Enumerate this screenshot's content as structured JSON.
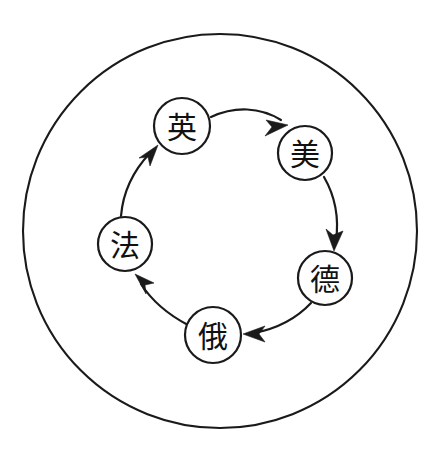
{
  "diagram": {
    "type": "cycle-diagram",
    "title": "",
    "background_color": "#ffffff",
    "stroke_color": "#1a1a1a",
    "outer_boundary": {
      "name": "outer-circle",
      "shape": "circle",
      "cx": 220,
      "cy": 231,
      "r": 197
    },
    "nodes": [
      {
        "id": "uk",
        "label": "英",
        "cx": 182,
        "cy": 126,
        "r": 28
      },
      {
        "id": "usa",
        "label": "美",
        "cx": 305,
        "cy": 153,
        "r": 27
      },
      {
        "id": "germany",
        "label": "德",
        "cx": 325,
        "cy": 278,
        "r": 27
      },
      {
        "id": "russia",
        "label": "俄",
        "cx": 213,
        "cy": 335,
        "r": 28
      },
      {
        "id": "france",
        "label": "法",
        "cx": 125,
        "cy": 244,
        "r": 27
      }
    ],
    "edges": [
      {
        "id": "uk-to-usa",
        "from": "英",
        "to": "美",
        "direction": "clockwise",
        "arrow": "barbed"
      },
      {
        "id": "usa-to-germany",
        "from": "美",
        "to": "德",
        "direction": "clockwise",
        "arrow": "barbed"
      },
      {
        "id": "germany-to-russia",
        "from": "德",
        "to": "俄",
        "direction": "clockwise",
        "arrow": "barbed"
      },
      {
        "id": "russia-to-france",
        "from": "俄",
        "to": "法",
        "direction": "clockwise",
        "arrow": "barbed"
      },
      {
        "id": "france-to-uk",
        "from": "法",
        "to": "英",
        "direction": "clockwise",
        "arrow": "barbed"
      }
    ]
  }
}
